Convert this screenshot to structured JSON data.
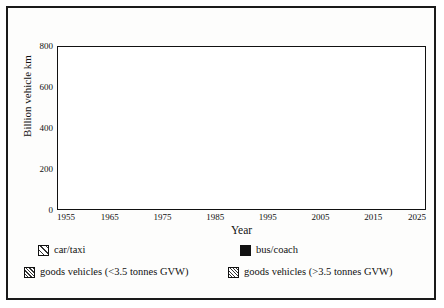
{
  "chart_data": {
    "type": "area",
    "title": "",
    "xlabel": "Year",
    "ylabel": "Billion vehicle km",
    "xlim": [
      1955,
      2025
    ],
    "ylim": [
      0,
      800
    ],
    "grid": false,
    "stacked": true,
    "legend_position": "bottom",
    "x": [
      1955,
      1960,
      1965,
      1970,
      1975,
      1980,
      1985,
      1988,
      1990,
      1995,
      2000,
      2005,
      2010,
      2015,
      2020,
      2025
    ],
    "xticks_major": [
      1955,
      1965,
      1975,
      1985,
      1995,
      2005,
      2015,
      2025
    ],
    "xticks_minor": [
      1960,
      1970,
      1980,
      1990,
      2000,
      2010,
      2020
    ],
    "yticks_major": [
      0,
      200,
      400,
      600,
      800
    ],
    "yticks_minor": [
      100,
      300,
      500,
      700
    ],
    "series": [
      {
        "name": "car/taxi",
        "pattern": "diagonal-hatch",
        "values": [
          40,
          75,
          110,
          143,
          170,
          196,
          232,
          285,
          320,
          370,
          418,
          462,
          505,
          548,
          588,
          622
        ]
      },
      {
        "name": "bus/coach",
        "pattern": "solid-black",
        "values": [
          10,
          10,
          9,
          8,
          8,
          7,
          7,
          7,
          7,
          7,
          7,
          7,
          7,
          7,
          7,
          7
        ]
      },
      {
        "name": "goods vehicles (<3.5 tonnes GVW)",
        "pattern": "dense-diagonal-hatch",
        "values": [
          13,
          15,
          18,
          21,
          24,
          26,
          28,
          34,
          38,
          44,
          50,
          55,
          60,
          65,
          70,
          74
        ]
      },
      {
        "name": "goods vehicles (>3.5 tonnes GVW)",
        "pattern": "cross-hatch",
        "values": [
          12,
          15,
          18,
          21,
          23,
          25,
          27,
          31,
          34,
          38,
          43,
          48,
          52,
          56,
          60,
          62
        ]
      }
    ],
    "totals": [
      75,
      115,
      155,
      193,
      225,
      254,
      294,
      357,
      399,
      459,
      518,
      572,
      624,
      676,
      725,
      765
    ]
  },
  "axes": {
    "y_title": "Billion vehicle km",
    "x_title": "Year",
    "y_tick_labels": [
      "0",
      "200",
      "400",
      "600",
      "800"
    ],
    "x_tick_labels": [
      "1955",
      "1965",
      "1975",
      "1985",
      "1995",
      "2005",
      "2015",
      "2025"
    ]
  },
  "legend": {
    "items": [
      {
        "label": "car/taxi",
        "pattern": "diagonal-hatch"
      },
      {
        "label": "bus/coach",
        "pattern": "solid-black"
      },
      {
        "label": "goods vehicles (<3.5 tonnes GVW)",
        "pattern": "dense-diagonal-hatch"
      },
      {
        "label": "goods vehicles (>3.5 tonnes GVW)",
        "pattern": "cross-hatch"
      }
    ]
  },
  "colors": {
    "ink": "#111111",
    "paper": "#ffffff",
    "frame": "#1a1a1a"
  }
}
